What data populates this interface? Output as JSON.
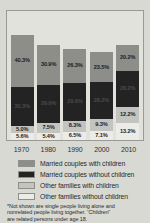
{
  "chart_data": {
    "type": "bar",
    "subtype": "stacked-bar",
    "title": "",
    "subtitle": "",
    "xlabel": "",
    "ylabel": "",
    "grid": false,
    "legend_position": "bottom",
    "categories": [
      "1970",
      "1980",
      "1990",
      "2000",
      "2010"
    ],
    "series": [
      {
        "name": "Married couples with children",
        "color": "#8d8d8a",
        "values": [
          40.3,
          30.9,
          26.3,
          23.5,
          20.2
        ],
        "labels": [
          "40.3%",
          "30.9%",
          "26.3%",
          "23.5%",
          "20.2%"
        ]
      },
      {
        "name": "Married couples without children",
        "color": "#232323",
        "values": [
          30.3,
          29.9,
          29.6,
          28.2,
          28.2
        ],
        "labels": [
          "30.3%",
          "29.9%",
          "29.6%",
          "28.2%",
          "28.2%"
        ]
      },
      {
        "name": "Other families with children",
        "color": "#c3c3bf",
        "values": [
          5.0,
          7.5,
          8.3,
          9.3,
          12.2
        ],
        "labels": [
          "5.0%",
          "7.5%",
          "8.3%",
          "9.3%",
          "12.2%"
        ]
      },
      {
        "name": "Other families without children",
        "color": "#ebebe7",
        "values": [
          5.6,
          5.4,
          6.5,
          7.1,
          13.2
        ],
        "labels": [
          "5.6%",
          "5.4%",
          "6.5%",
          "7.1%",
          "13.2%"
        ]
      }
    ],
    "column_totals": [
      81.2,
      73.7,
      70.7,
      68.1,
      73.8
    ],
    "ylim": [
      0,
      100
    ],
    "value_unit": "percent",
    "annotations": [
      "Not shown are single people living alone and nonrelated people living together."
    ]
  },
  "axis": {
    "ticks": [
      "1970",
      "1980",
      "1990",
      "2000",
      "2010"
    ]
  },
  "legend": {
    "items": [
      {
        "label": "Married couples with children",
        "color": "#8d8d8a"
      },
      {
        "label": "Married couples without children",
        "color": "#232323"
      },
      {
        "label": "Other families with children",
        "color": "#c3c3bf"
      },
      {
        "label": "Other families without children",
        "color": "#ebebe7"
      }
    ]
  },
  "footnote": {
    "line1": "*Not shown are single people living alone and",
    "line2": "nonrelated people living together. “Children”",
    "line3": "are related persons under age 18."
  }
}
